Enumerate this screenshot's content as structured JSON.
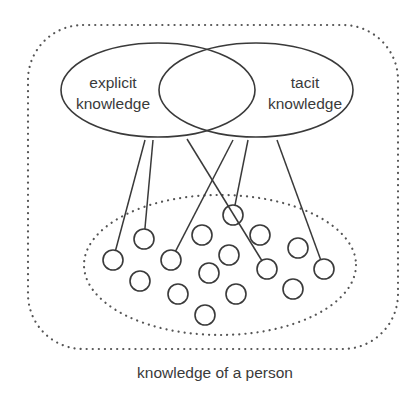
{
  "diagram": {
    "title": "knowledge of a person",
    "colors": {
      "stroke": "#3a3a3a",
      "dotted": "#555555",
      "background": "#ffffff",
      "text": "#3a3a3a"
    },
    "outer_boundary": {
      "label": "knowledge of a person",
      "style": "dotted",
      "x": 28,
      "y": 25,
      "width": 370,
      "height": 324,
      "corner_radius": 55
    },
    "sets": [
      {
        "id": "explicit",
        "line1": "explicit",
        "line2": "knowledge",
        "cx": 158,
        "cy": 90,
        "rx": 97,
        "ry": 47
      },
      {
        "id": "tacit",
        "line1": "tacit",
        "line2": "knowledge",
        "cx": 256,
        "cy": 90,
        "rx": 97,
        "ry": 47
      }
    ],
    "inner_cluster": {
      "style": "dotted",
      "cx": 220,
      "cy": 265,
      "rx": 136,
      "ry": 70
    },
    "nodes": [
      {
        "id": "n1",
        "cx": 113,
        "cy": 260
      },
      {
        "id": "n2",
        "cx": 144,
        "cy": 239
      },
      {
        "id": "n3",
        "cx": 171,
        "cy": 260
      },
      {
        "id": "n4",
        "cx": 140,
        "cy": 281
      },
      {
        "id": "n5",
        "cx": 178,
        "cy": 294
      },
      {
        "id": "n6",
        "cx": 202,
        "cy": 235
      },
      {
        "id": "n7",
        "cx": 209,
        "cy": 273
      },
      {
        "id": "n8",
        "cx": 205,
        "cy": 315
      },
      {
        "id": "n9",
        "cx": 229,
        "cy": 255
      },
      {
        "id": "n10",
        "cx": 236,
        "cy": 294
      },
      {
        "id": "n11",
        "cx": 233,
        "cy": 215
      },
      {
        "id": "n12",
        "cx": 260,
        "cy": 235
      },
      {
        "id": "n13",
        "cx": 267,
        "cy": 269
      },
      {
        "id": "n14",
        "cx": 298,
        "cy": 248
      },
      {
        "id": "n15",
        "cx": 293,
        "cy": 289
      },
      {
        "id": "n16",
        "cx": 324,
        "cy": 269
      }
    ],
    "node_radius": 10,
    "links": [
      {
        "from": "explicit",
        "x1": 145,
        "y1": 140,
        "to": "n1"
      },
      {
        "from": "explicit",
        "x1": 153,
        "y1": 140,
        "to": "n2"
      },
      {
        "from": "explicit",
        "x1": 187,
        "y1": 139,
        "to": "n13"
      },
      {
        "from": "tacit",
        "x1": 233,
        "y1": 140,
        "to": "n3"
      },
      {
        "from": "tacit",
        "x1": 248,
        "y1": 140,
        "to": "n11"
      },
      {
        "from": "tacit",
        "x1": 277,
        "y1": 140,
        "to": "n16"
      }
    ]
  }
}
